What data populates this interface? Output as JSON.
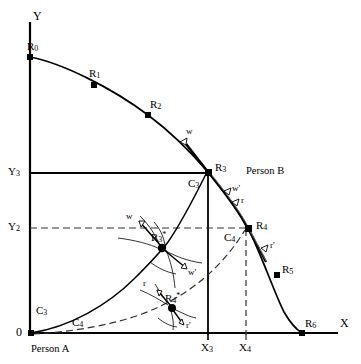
{
  "figure": {
    "type": "diagram",
    "background_color": "#ffffff",
    "stroke_color": "#000000",
    "width": 361,
    "height": 364
  },
  "axes": {
    "x_label": "X",
    "y_label": "Y",
    "origin_label": "0",
    "x_ticks": [
      {
        "label": "X",
        "sub": "3",
        "x": 208
      },
      {
        "label": "X",
        "sub": "4",
        "x": 246
      }
    ],
    "y_ticks": [
      {
        "label": "Y",
        "sub": "3",
        "y": 173
      },
      {
        "label": "Y",
        "sub": "2",
        "y": 228
      }
    ]
  },
  "actors": {
    "person_a": "Person A",
    "person_b": "Person B"
  },
  "frontier_points": [
    {
      "name": "R",
      "sub": "0",
      "x": 30,
      "y": 57
    },
    {
      "name": "R",
      "sub": "1",
      "x": 94,
      "y": 85
    },
    {
      "name": "R",
      "sub": "2",
      "x": 148,
      "y": 115
    },
    {
      "name": "R",
      "sub": "3",
      "x": 208,
      "y": 172
    },
    {
      "name": "R",
      "sub": "4",
      "x": 248,
      "y": 228
    },
    {
      "name": "R",
      "sub": "5",
      "x": 277,
      "y": 275
    },
    {
      "name": "R",
      "sub": "6",
      "x": 302,
      "y": 333
    }
  ],
  "star_points": [
    {
      "name": "R",
      "sub": "3",
      "star": "*",
      "x": 162,
      "y": 247
    },
    {
      "name": "R",
      "sub": "4",
      "star": "*",
      "x": 172,
      "y": 307
    }
  ],
  "contract_curves": [
    {
      "name": "C",
      "sub": "3",
      "label_x": 40,
      "label_y": 311
    },
    {
      "name": "C",
      "sub": "4",
      "label_x": 75,
      "label_y": 322
    },
    {
      "name": "C",
      "sub": "3",
      "label_x": 192,
      "label_y": 184
    },
    {
      "name": "C",
      "sub": "4",
      "label_x": 228,
      "label_y": 238
    }
  ],
  "vector_labels": [
    {
      "text": "w",
      "x": 189,
      "y": 130
    },
    {
      "text": "w'",
      "x": 232,
      "y": 189
    },
    {
      "text": "r",
      "x": 240,
      "y": 200
    },
    {
      "text": "r'",
      "x": 270,
      "y": 246
    },
    {
      "text": "w",
      "x": 128,
      "y": 216
    },
    {
      "text": "w'",
      "x": 190,
      "y": 272
    },
    {
      "text": "r",
      "x": 145,
      "y": 283
    },
    {
      "text": "r'",
      "x": 188,
      "y": 325
    }
  ]
}
